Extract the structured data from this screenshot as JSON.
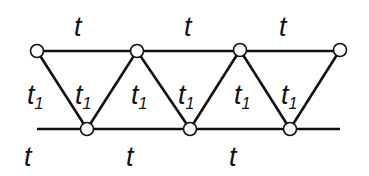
{
  "diagram": {
    "type": "triangular-ladder-lattice",
    "colors": {
      "line": "#111111",
      "node_fill": "#ffffff",
      "node_stroke": "#111111",
      "background": "#ffffff"
    },
    "top_nodes": [
      [
        37,
        51
      ],
      [
        137,
        51
      ],
      [
        240,
        50
      ],
      [
        340,
        50
      ]
    ],
    "bottom_nodes": [
      [
        87,
        129
      ],
      [
        190,
        129
      ],
      [
        290,
        129
      ]
    ],
    "top_line": {
      "x1": 37,
      "x2": 340,
      "y": 51
    },
    "bottom_line": {
      "x1": 37,
      "x2": 340,
      "y": 129
    },
    "labels": {
      "top": [
        {
          "text": "t",
          "x": 74,
          "y": 36
        },
        {
          "text": "t",
          "x": 184,
          "y": 36
        },
        {
          "text": "t",
          "x": 279,
          "y": 36
        }
      ],
      "bottom": [
        {
          "text": "t",
          "x": 24,
          "y": 166
        },
        {
          "text": "t",
          "x": 126,
          "y": 166
        },
        {
          "text": "t",
          "x": 229,
          "y": 166
        }
      ],
      "diagonal": [
        {
          "text": "t",
          "sub": "1",
          "x": 27,
          "y": 104
        },
        {
          "text": "t",
          "sub": "1",
          "x": 75,
          "y": 104
        },
        {
          "text": "t",
          "sub": "1",
          "x": 131,
          "y": 104
        },
        {
          "text": "t",
          "sub": "1",
          "x": 178,
          "y": 104
        },
        {
          "text": "t",
          "sub": "1",
          "x": 234,
          "y": 104
        },
        {
          "text": "t",
          "sub": "1",
          "x": 281,
          "y": 104
        }
      ]
    }
  }
}
